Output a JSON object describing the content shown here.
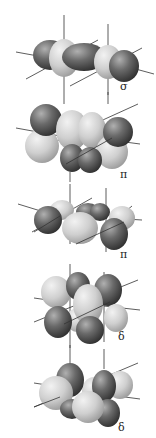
{
  "figure": {
    "panels": [
      {
        "symbol": "σ",
        "type": "sigma"
      },
      {
        "symbol": "π",
        "type": "pi"
      },
      {
        "symbol": "π",
        "type": "pi"
      },
      {
        "symbol": "δ",
        "type": "delta"
      },
      {
        "symbol": "δ",
        "type": "delta"
      }
    ]
  },
  "colors": {
    "dark_lobe": "#555555",
    "light_lobe": "#c8c8c8",
    "axis": "#333333",
    "background": "#ffffff"
  }
}
